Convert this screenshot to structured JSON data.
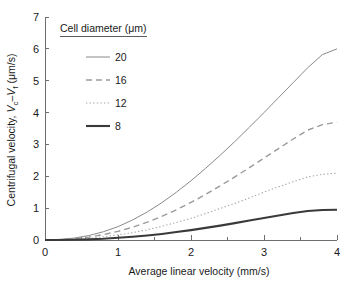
{
  "chart_data": {
    "type": "line",
    "title": "",
    "xlabel": "Average linear velocity (mm/s)",
    "ylabel": "Centrifugal velocity, Vc–Vf (μm/s)",
    "ylabel_parts": {
      "prefix": "Centrifugal velocity, ",
      "v1": "V",
      "v1sub": "c",
      "dash": "–",
      "v2": "V",
      "v2sub": "f",
      "units": " (μm/s)"
    },
    "xlim": [
      0,
      4
    ],
    "ylim": [
      0,
      7
    ],
    "xticks": [
      0,
      1,
      2,
      3,
      4
    ],
    "yticks": [
      0,
      1,
      2,
      3,
      4,
      5,
      6,
      7
    ],
    "xtick_labels": [
      "0",
      "1",
      "2",
      "3",
      "4"
    ],
    "ytick_labels": [
      "0",
      "1",
      "2",
      "3",
      "4",
      "5",
      "6",
      "7"
    ],
    "x_minor_ticks": [
      0.5,
      1.5,
      2.5,
      3.5
    ],
    "grid": false,
    "legend_position": "upper-left-inside",
    "legend_title": "Cell diameter (μm)",
    "x": [
      0,
      0.2,
      0.4,
      0.6,
      0.8,
      1.0,
      1.2,
      1.4,
      1.6,
      1.8,
      2.0,
      2.2,
      2.4,
      2.6,
      2.8,
      3.0,
      3.2,
      3.4,
      3.6,
      3.8,
      4.0
    ],
    "series": [
      {
        "name": "20",
        "label": "20",
        "style": "solid-thin",
        "color": "#8a8a8a",
        "values": [
          0,
          0.02,
          0.06,
          0.14,
          0.26,
          0.42,
          0.63,
          0.88,
          1.17,
          1.5,
          1.86,
          2.25,
          2.66,
          3.09,
          3.54,
          4.0,
          4.47,
          4.94,
          5.41,
          5.82,
          6.0
        ]
      },
      {
        "name": "16",
        "label": "16",
        "style": "dashed",
        "color": "#9a9a9a",
        "values": [
          0,
          0.01,
          0.04,
          0.09,
          0.17,
          0.27,
          0.4,
          0.56,
          0.74,
          0.95,
          1.18,
          1.43,
          1.7,
          1.98,
          2.27,
          2.57,
          2.87,
          3.17,
          3.45,
          3.62,
          3.7
        ]
      },
      {
        "name": "12",
        "label": "12",
        "style": "dotted",
        "color": "#a8a8a8",
        "values": [
          0,
          0.01,
          0.02,
          0.05,
          0.1,
          0.16,
          0.23,
          0.32,
          0.43,
          0.55,
          0.68,
          0.83,
          0.99,
          1.15,
          1.32,
          1.5,
          1.67,
          1.83,
          1.98,
          2.06,
          2.1
        ]
      },
      {
        "name": "8",
        "label": "8",
        "style": "solid-thick",
        "color": "#3a3a3a",
        "values": [
          0,
          0.0,
          0.01,
          0.02,
          0.04,
          0.07,
          0.1,
          0.14,
          0.19,
          0.25,
          0.31,
          0.38,
          0.45,
          0.53,
          0.61,
          0.69,
          0.77,
          0.85,
          0.91,
          0.94,
          0.95
        ]
      }
    ]
  }
}
